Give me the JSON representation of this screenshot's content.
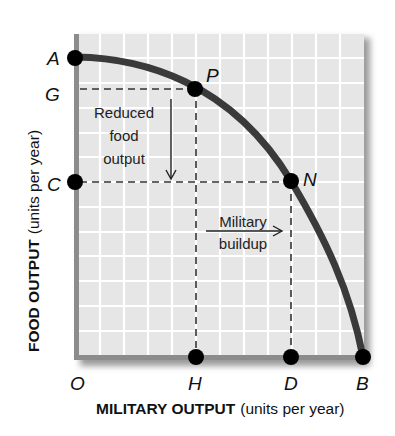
{
  "diagram": {
    "type": "production-possibilities-frontier",
    "x_axis": {
      "title_bold": "MILITARY OUTPUT",
      "title_units": "(units per year)"
    },
    "y_axis": {
      "title_bold": "FOOD OUTPUT",
      "title_units": "(units per year)"
    },
    "points": {
      "A": {
        "label": "A"
      },
      "G": {
        "label": "G"
      },
      "C": {
        "label": "C"
      },
      "P": {
        "label": "P"
      },
      "N": {
        "label": "N"
      },
      "O": {
        "label": "O"
      },
      "H": {
        "label": "H"
      },
      "D": {
        "label": "D"
      },
      "B": {
        "label": "B"
      }
    },
    "annotations": {
      "reduced_food": [
        "Reduced",
        "food",
        "output"
      ],
      "military_buildup": [
        "Military",
        "buildup"
      ]
    },
    "colors": {
      "curve": "#3a3a3a",
      "grid_bg": "#e6e6e6",
      "grid_line": "#ffffff",
      "axis": "#8c8c8c",
      "dot": "#000000"
    }
  }
}
